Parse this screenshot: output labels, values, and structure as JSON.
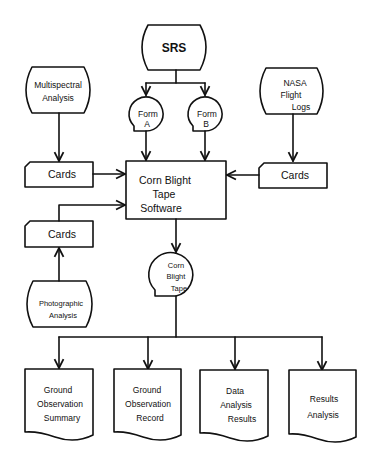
{
  "diagram": {
    "type": "flowchart",
    "nodes": {
      "srs": {
        "label": "SRS",
        "shape": "terminal"
      },
      "form_a": {
        "line1": "Form",
        "line2": "A",
        "shape": "tape-reel"
      },
      "form_b": {
        "line1": "Form",
        "line2": "B",
        "shape": "tape-reel"
      },
      "multispectral": {
        "line1": "Multispectral",
        "line2": "Analysis",
        "shape": "terminal"
      },
      "nasa": {
        "line1": "NASA",
        "line2": "Flight",
        "line3": "Logs",
        "shape": "terminal"
      },
      "cards_left": {
        "label": "Cards",
        "shape": "punched-card"
      },
      "cards_right": {
        "label": "Cards",
        "shape": "punched-card"
      },
      "cards_photo": {
        "label": "Cards",
        "shape": "punched-card"
      },
      "software": {
        "line1": "Corn Blight",
        "line2": "Tape",
        "line3": "Software",
        "shape": "process"
      },
      "photographic": {
        "line1": "Photographic",
        "line2": "Analysis",
        "shape": "terminal"
      },
      "tape": {
        "line1": "Corn",
        "line2": "Blight",
        "line3": "Tape",
        "shape": "tape-reel"
      },
      "doc1": {
        "line1": "Ground",
        "line2": "Observation",
        "line3": "Summary",
        "shape": "document"
      },
      "doc2": {
        "line1": "Ground",
        "line2": "Observation",
        "line3": "Record",
        "shape": "document"
      },
      "doc3": {
        "line1": "Data",
        "line2": "Analysis",
        "line3": "Results",
        "shape": "document"
      },
      "doc4": {
        "line1": "Results",
        "line2": "Analysis",
        "shape": "document"
      }
    },
    "edges": [
      [
        "SRS",
        "Form A"
      ],
      [
        "SRS",
        "Form B"
      ],
      [
        "Form A",
        "Corn Blight Tape Software"
      ],
      [
        "Form B",
        "Corn Blight Tape Software"
      ],
      [
        "Multispectral Analysis",
        "Cards"
      ],
      [
        "Cards",
        "Corn Blight Tape Software"
      ],
      [
        "NASA Flight Logs",
        "Cards"
      ],
      [
        "Cards",
        "Corn Blight Tape Software"
      ],
      [
        "Photographic Analysis",
        "Cards"
      ],
      [
        "Cards",
        "Corn Blight Tape Software"
      ],
      [
        "Corn Blight Tape Software",
        "Corn Blight Tape"
      ],
      [
        "Corn Blight Tape",
        "Ground Observation Summary"
      ],
      [
        "Corn Blight Tape",
        "Ground Observation Record"
      ],
      [
        "Corn Blight Tape",
        "Data Analysis Results"
      ],
      [
        "Corn Blight Tape",
        "Results Analysis"
      ]
    ]
  }
}
